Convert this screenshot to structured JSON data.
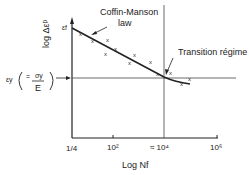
{
  "diagram": {
    "type": "fatigue-strain-life-plot",
    "y_axis": {
      "label": "log Δεᵖ",
      "top_marker": "εf"
    },
    "x_axis": {
      "label": "Log Nf",
      "ticks": [
        "1/4",
        "10²",
        "≈ 10⁴",
        "10⁶"
      ]
    },
    "annotations": {
      "coffin_manson": [
        "Coffin-Manson",
        "law"
      ],
      "transition": "Transition régime"
    },
    "yield_strain": {
      "symbol": "εy",
      "numerator": "σy",
      "denominator": "E",
      "equals": "="
    },
    "data_markers": "x",
    "colors": {
      "line": "#222222",
      "background": "#ffffff"
    }
  }
}
